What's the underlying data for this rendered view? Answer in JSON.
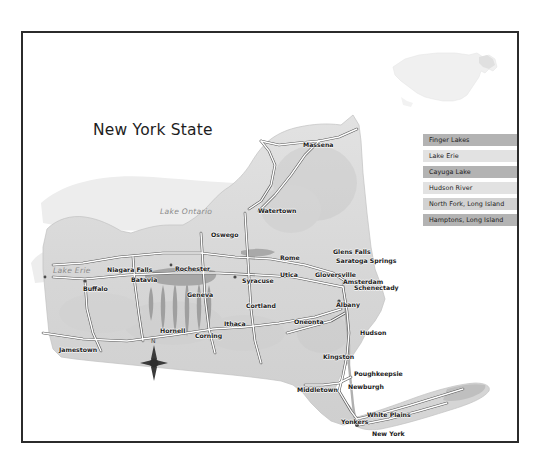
{
  "page": {
    "title": "New York State",
    "width": 539,
    "height": 472,
    "background": "#ffffff",
    "frame_color": "#2b2b2b"
  },
  "colors": {
    "land": "#d9d9d9",
    "land_edge": "#bdbdbd",
    "water_body": "#a9a9a9",
    "highway_fill": "#ffffff",
    "highway_stroke": "#555555",
    "label_city": "#1a1a1a",
    "label_water": "#8a8a8a",
    "legend_dark": "#b3b3b3",
    "legend_light": "#e2e2e2",
    "inset_land": "#f0f0f0",
    "inset_highlight": "#e3e3e3"
  },
  "legend": {
    "name": "map-legend",
    "items": [
      {
        "label": "Finger Lakes",
        "swatch": "#b3b3b3"
      },
      {
        "label": "Lake Erie",
        "swatch": "#e2e2e2"
      },
      {
        "label": "Cayuga Lake",
        "swatch": "#b3b3b3"
      },
      {
        "label": "Hudson River",
        "swatch": "#e2e2e2"
      },
      {
        "label": "North Fork, Long Island",
        "swatch": "#d2d2d2"
      },
      {
        "label": "Hamptons, Long Island",
        "swatch": "#b3b3b3"
      }
    ]
  },
  "compass": {
    "north_label": "N"
  },
  "inset": {
    "name": "united-states-inset",
    "highlight_state": "New York"
  },
  "water_labels": [
    {
      "label": "Lake Ontario",
      "x": 137,
      "y": 174
    },
    {
      "label": "Lake Erie",
      "x": 30,
      "y": 233
    }
  ],
  "cities": [
    {
      "label": "Massena",
      "x": 280,
      "y": 108
    },
    {
      "label": "Watertown",
      "x": 235,
      "y": 174
    },
    {
      "label": "Oswego",
      "x": 188,
      "y": 198
    },
    {
      "label": "Niagara Falls",
      "x": 84,
      "y": 233
    },
    {
      "label": "Rochester",
      "x": 152,
      "y": 232
    },
    {
      "label": "Rome",
      "x": 257,
      "y": 221
    },
    {
      "label": "Glens Falls",
      "x": 310,
      "y": 215
    },
    {
      "label": "Saratoga Springs",
      "x": 313,
      "y": 224
    },
    {
      "label": "Buffalo",
      "x": 60,
      "y": 252
    },
    {
      "label": "Batavia",
      "x": 108,
      "y": 243
    },
    {
      "label": "Syracuse",
      "x": 219,
      "y": 244
    },
    {
      "label": "Utica",
      "x": 257,
      "y": 238
    },
    {
      "label": "Gloversville",
      "x": 292,
      "y": 238
    },
    {
      "label": "Amsterdam",
      "x": 320,
      "y": 245
    },
    {
      "label": "Schenectady",
      "x": 331,
      "y": 251
    },
    {
      "label": "Geneva",
      "x": 164,
      "y": 258
    },
    {
      "label": "Cortland",
      "x": 223,
      "y": 269
    },
    {
      "label": "Albany",
      "x": 313,
      "y": 268
    },
    {
      "label": "Ithaca",
      "x": 201,
      "y": 287
    },
    {
      "label": "Oneonta",
      "x": 271,
      "y": 285
    },
    {
      "label": "Hornell",
      "x": 137,
      "y": 294
    },
    {
      "label": "Corning",
      "x": 172,
      "y": 299
    },
    {
      "label": "Hudson",
      "x": 337,
      "y": 296
    },
    {
      "label": "Jamestown",
      "x": 36,
      "y": 313
    },
    {
      "label": "Kingston",
      "x": 300,
      "y": 320
    },
    {
      "label": "Poughkeepsie",
      "x": 331,
      "y": 337
    },
    {
      "label": "Middletown",
      "x": 274,
      "y": 353
    },
    {
      "label": "Newburgh",
      "x": 325,
      "y": 350
    },
    {
      "label": "White Plains",
      "x": 344,
      "y": 378
    },
    {
      "label": "Yonkers",
      "x": 318,
      "y": 385
    },
    {
      "label": "New York",
      "x": 349,
      "y": 397
    }
  ]
}
